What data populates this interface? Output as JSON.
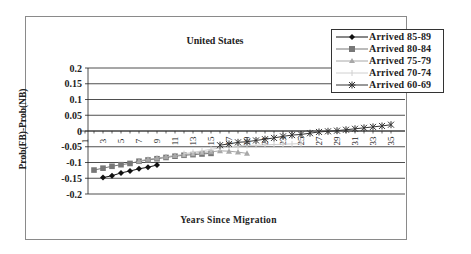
{
  "chart_data": {
    "type": "line",
    "title": "United States",
    "xlabel": "Years Since Migration",
    "ylabel": "Prob(FB)-Prob(NB)",
    "ylim": [
      -0.2,
      0.2
    ],
    "yticks": [
      "0.2",
      "0.15",
      "0.1",
      "0.05",
      "0",
      "-0.05",
      "-0.1",
      "-0.15",
      "-0.2"
    ],
    "xticks": [
      "1",
      "3",
      "5",
      "7",
      "9",
      "11",
      "13",
      "15",
      "17",
      "19",
      "21",
      "23",
      "25",
      "27",
      "29",
      "31",
      "33",
      "35"
    ],
    "x_range": [
      1,
      35
    ],
    "grid": true,
    "legend_position": "top-right",
    "series": [
      {
        "name": "Arrived 85-89",
        "marker": "diamond",
        "color": "#111111",
        "x": [
          3,
          4,
          5,
          6,
          7,
          8,
          9
        ],
        "values": [
          -0.148,
          -0.142,
          -0.133,
          -0.127,
          -0.12,
          -0.115,
          -0.108
        ]
      },
      {
        "name": "Arrived 80-84",
        "marker": "square",
        "color": "#777777",
        "x": [
          2,
          3,
          4,
          5,
          6,
          7,
          8,
          9,
          10,
          11,
          12,
          13,
          14,
          15
        ],
        "values": [
          -0.124,
          -0.118,
          -0.112,
          -0.107,
          -0.103,
          -0.096,
          -0.092,
          -0.088,
          -0.084,
          -0.08,
          -0.077,
          -0.075,
          -0.073,
          -0.071
        ]
      },
      {
        "name": "Arrived 75-79",
        "marker": "triangle",
        "color": "#a8a8a8",
        "x": [
          7,
          8,
          9,
          10,
          11,
          12,
          13,
          14,
          15,
          16,
          17,
          18,
          19
        ],
        "values": [
          -0.095,
          -0.09,
          -0.086,
          -0.082,
          -0.078,
          -0.075,
          -0.072,
          -0.068,
          -0.066,
          -0.063,
          -0.064,
          -0.067,
          -0.071
        ]
      },
      {
        "name": "Arrived 70-74",
        "marker": "plus",
        "color": "#d0d0d0",
        "x": [
          12,
          13,
          14,
          15,
          16,
          17,
          18,
          19,
          20,
          21,
          22,
          23,
          24,
          25
        ],
        "values": [
          -0.072,
          -0.068,
          -0.063,
          -0.058,
          -0.054,
          -0.05,
          -0.048,
          -0.046,
          -0.045,
          -0.044,
          -0.043,
          -0.042,
          -0.041,
          -0.04
        ]
      },
      {
        "name": "Arrived 60-69",
        "marker": "star",
        "color": "#333333",
        "x": [
          16,
          17,
          18,
          19,
          20,
          21,
          22,
          23,
          24,
          25,
          26,
          27,
          28,
          29,
          30,
          31,
          32,
          33,
          34,
          35
        ],
        "values": [
          -0.045,
          -0.041,
          -0.036,
          -0.034,
          -0.03,
          -0.026,
          -0.022,
          -0.017,
          -0.013,
          -0.011,
          -0.007,
          -0.003,
          -0.001,
          0.001,
          0.004,
          0.007,
          0.01,
          0.013,
          0.016,
          0.02
        ]
      }
    ]
  }
}
